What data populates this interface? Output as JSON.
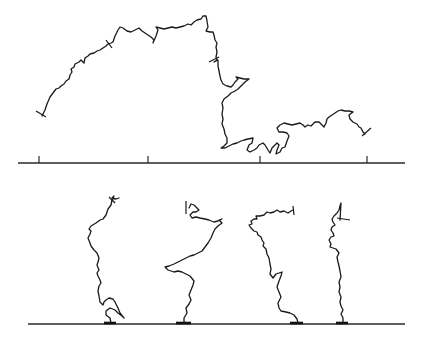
{
  "figure": {
    "colors": {
      "line": "#1a1a1a",
      "background": "#ffffff"
    }
  },
  "top_panel": {
    "baseline": {
      "x1": 18,
      "x2": 405,
      "y": 163
    },
    "ticks": [
      {
        "x": 39,
        "y1": 156,
        "y2": 163
      },
      {
        "x": 148,
        "y1": 156,
        "y2": 163
      },
      {
        "x": 260,
        "y1": 156,
        "y2": 163
      },
      {
        "x": 367,
        "y1": 156,
        "y2": 163
      }
    ],
    "chain": {
      "path": "M42,116 L45,110 L47,104 L50,97 L53,93 L56,89 L59,88 L61,86 L64,84 L66,81 L69,79 L70,75 L72,72 L71,69 L74,67 L75,64 L79,62 L81,60 L84,63 L85,58 L88,56 L90,54 L94,53 L97,51 L100,50 L103,48 L106,46 L108,44 L111,43 L113,42 L115,36 L118,30 L120,27 L123,28 L127,31 L131,32 L135,30 L139,28 L142,31 L145,33 L148,35 L151,37 L154,40 L153,43 L156,36 L158,30 L156,27 L160,28 L164,29 L168,28 L172,27 L176,28 L180,27 L184,26 L188,24 L191,25 L194,22 L197,20 L201,19 L203,16 L206,16 L207,21 L208,27 L206,31 L210,32 L213,32 L214,35 L215,40 L217,43 L216,47 L217,52 L216,57 L217,60 L214,62 L218,60 L218,66 L219,71 L220,76 L221,80 L223,84 L227,86 L231,87 L233,85 L235,82 L238,79 L236,77 L240,78 L244,79 L249,79 L245,82 L241,86 L238,89 L235,91 L231,93 L228,96 L224,99 L222,103 L223,108 L222,114 L223,119 L222,124 L224,129 L225,134 L227,138 L227,143 L224,146 L221,148 L225,148 L229,146 L233,144 L237,143 L241,141 L244,140 L248,139 L253,138 L252,143 L249,145 L247,150 L250,152 L254,150 L257,148 L259,145 L263,143 L265,145 L268,150 L270,153 L272,148 L275,145 L277,143 L279,145 L277,150 L276,154 L280,152 L282,148 L285,147 L287,141 L289,136 L287,133 L283,132 L279,132 L277,128 L280,125 L284,123 L288,124 L292,125 L296,124 L300,123 L303,125 L305,127 L308,125 L311,126 L313,124 L315,122 L319,122 L322,125 L324,127 L326,123 L327,119 L329,117 L332,115 L335,113 L338,111 L341,110 L345,111 L349,111 L353,112 L349,115 L350,119 L353,122 L357,124 L359,127 L361,128 L363,132 L365,134",
      "start_cap": {
        "x1": 36,
        "y1": 111,
        "x2": 46,
        "y2": 117
      },
      "end_cap": {
        "x1": 362,
        "y1": 136,
        "x2": 371,
        "y2": 128
      },
      "mid_marks": [
        {
          "x1": 106,
          "y1": 40,
          "x2": 112,
          "y2": 48
        },
        {
          "x1": 209,
          "y1": 62,
          "x2": 219,
          "y2": 57
        }
      ]
    }
  },
  "bottom_panel": {
    "baseline": {
      "x1": 28,
      "x2": 405,
      "y": 324
    },
    "grafted_chains": [
      {
        "id": "chain-1",
        "anchor": {
          "x1": 104,
          "x2": 116,
          "y": 323
        },
        "path": "M111,323 L110,318 L106,315 L106,311 L110,308 L115,310 L118,313 L122,316 L124,318 L120,313 L118,308 L115,302 L113,299 L109,298 L106,300 L104,302 L103,305 L100,302 L99,296 L98,291 L99,286 L101,283 L100,280 L98,276 L97,273 L99,270 L97,265 L98,262 L99,258 L97,253 L94,250 L91,246 L90,243 L88,238 L90,234 L91,231 L89,229 L91,226 L96,223 L100,220 L103,219 L106,215 L107,212 L108,209 L111,205 L112,200 L114,196 L112,198 L116,199 L119,198",
        "end_cap": {
          "x1": 109,
          "y1": 197,
          "x2": 115,
          "y2": 203
        }
      },
      {
        "id": "chain-2",
        "anchor": {
          "x1": 176,
          "x2": 191,
          "y": 323
        },
        "path": "M184,323 L184,318 L187,313 L186,308 L189,304 L191,300 L189,295 L191,290 L193,285 L194,281 L190,276 L186,274 L182,272 L178,271 L174,272 L168,270 L165,267 L169,266 L174,264 L178,262 L182,260 L186,258 L190,256 L194,255 L198,253 L202,251 L205,247 L208,243 L211,238 L213,233 L215,229 L218,226 L222,223 L219,220 L222,219 L218,221 L214,222 L209,220 L205,219 L200,218 L196,217 L192,218 L190,215 L193,212 L196,212 L199,210 L196,207 L194,205 L191,204 L189,208",
        "end_cap": {
          "x1": 186,
          "y1": 201,
          "x2": 186,
          "y2": 214
        }
      },
      {
        "id": "chain-3",
        "anchor": {
          "x1": 290,
          "x2": 303,
          "y": 323
        },
        "path": "M298,323 L297,319 L294,315 L290,313 L286,312 L281,311 L279,308 L278,303 L281,297 L279,292 L277,287 L279,281 L281,276 L282,272 L279,273 L276,274 L273,278 L270,274 L271,269 L270,264 L269,258 L267,254 L266,249 L263,246 L264,243 L262,240 L261,237 L258,235 L257,232 L254,231 L251,228 L249,225 L252,224 L251,221 L254,219 L257,219 L256,216 L260,216 L264,215 L267,212 L270,213 L274,212 L277,210 L280,212 L284,211 L288,213 L291,211 L293,210",
        "end_cap": {
          "x1": 293,
          "y1": 206,
          "x2": 294,
          "y2": 215
        }
      },
      {
        "id": "chain-4",
        "anchor": {
          "x1": 336,
          "x2": 348,
          "y": 323
        },
        "path": "M343,323 L343,318 L341,314 L343,310 L341,306 L340,302 L341,297 L339,292 L340,287 L339,282 L341,277 L340,271 L339,266 L338,262 L337,257 L339,253 L336,249 L333,248 L330,247 L331,244 L329,240 L331,237 L334,236 L333,233 L331,230 L332,227 L335,225 L333,222 L332,219 L334,216 L337,213 L339,210 L340,206 L341,203 L340,220",
        "end_cap": {
          "x1": 337,
          "y1": 218,
          "x2": 350,
          "y2": 220
        }
      }
    ]
  }
}
